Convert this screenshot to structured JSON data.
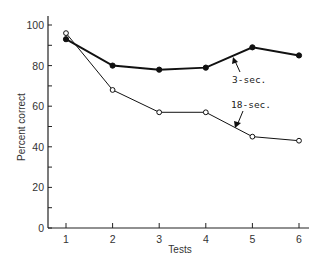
{
  "chart_data": {
    "type": "line",
    "title": "",
    "xlabel": "Tests",
    "ylabel": "Percent correct",
    "x": [
      1,
      2,
      3,
      4,
      5,
      6
    ],
    "xticks": [
      "1",
      "2",
      "3",
      "4",
      "5",
      "6"
    ],
    "yticks": [
      "0",
      "20",
      "40",
      "60",
      "80",
      "100"
    ],
    "ylim": [
      0,
      100
    ],
    "minor_ytick_step": 10,
    "grid": false,
    "legend": "inline annotations with arrows",
    "series": [
      {
        "name": "3-sec.",
        "marker": "filled-circle",
        "values": [
          93,
          80,
          78,
          79,
          89,
          85
        ]
      },
      {
        "name": "18-sec.",
        "marker": "open-circle",
        "values": [
          96,
          68,
          57,
          57,
          45,
          43
        ]
      }
    ],
    "annotations": [
      {
        "text": "3-sec.",
        "series": "3-sec."
      },
      {
        "text": "18-sec.",
        "series": "18-sec."
      }
    ]
  }
}
